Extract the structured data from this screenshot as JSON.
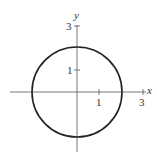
{
  "figure": {
    "type": "circle-graph",
    "axes": {
      "x_label": "x",
      "y_label": "y",
      "x_ticks": [
        {
          "value": 1,
          "label": "1"
        },
        {
          "value": 3,
          "label": "3"
        }
      ],
      "y_ticks": [
        {
          "value": 1,
          "label": "1"
        },
        {
          "value": 3,
          "label": "3"
        }
      ]
    },
    "curve": {
      "shape": "circle",
      "center": [
        0,
        0
      ],
      "radius": 2,
      "color": "#222222"
    }
  }
}
